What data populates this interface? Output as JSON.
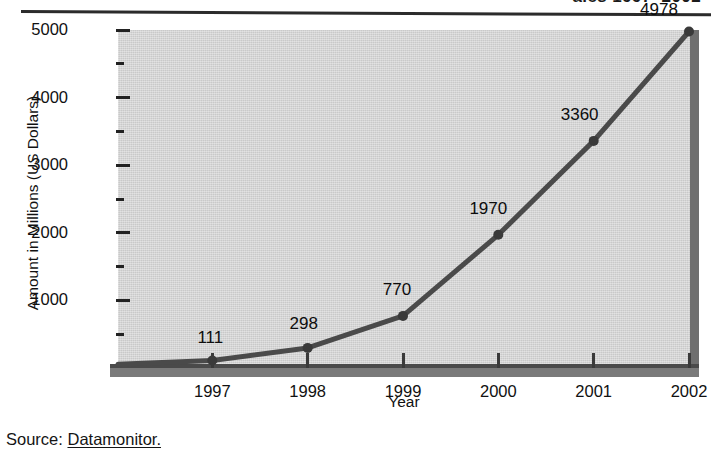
{
  "header": {
    "running_title": "ales 1997–2002"
  },
  "source": {
    "label": "Source:",
    "value": "Datamonitor."
  },
  "chart_data": {
    "type": "line",
    "title": "",
    "xlabel": "Year",
    "ylabel": "Amount in Millions (US Dollars)",
    "categories": [
      "1997",
      "1998",
      "1999",
      "2000",
      "2001",
      "2002"
    ],
    "values": [
      111,
      298,
      770,
      1970,
      3360,
      4978
    ],
    "point_labels": [
      "111",
      "298",
      "770",
      "1970",
      "3360",
      "4978"
    ],
    "ylim": [
      0,
      5000
    ],
    "yticks": [
      1000,
      2000,
      3000,
      4000,
      5000
    ],
    "ytick_labels": [
      "1000",
      "2000",
      "3000",
      "4000",
      "5000"
    ],
    "yminorticks": [
      500,
      1500,
      2500,
      3500,
      4500
    ],
    "grid": false,
    "legend": "none",
    "series": [
      {
        "name": "Amount",
        "values": [
          111,
          298,
          770,
          1970,
          3360,
          4978
        ]
      }
    ],
    "colors": {
      "plot_background": "#c9c9c9",
      "line": "#4a4a4a",
      "marker": "#3a3a3a",
      "axis": "#222222",
      "wall": "#6f6f6f"
    }
  }
}
